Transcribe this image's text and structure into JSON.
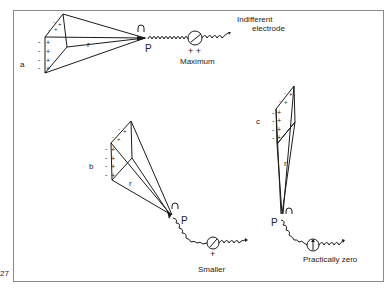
{
  "figure": {
    "page_number": "27",
    "frame_color": "#8a8a8a",
    "ink_color": "#1a1a1a"
  },
  "indifferent_electrode": {
    "line1": "Indifferent",
    "line2": "electrode"
  },
  "panels": [
    {
      "id": "a",
      "label": "a",
      "radius_label": "r",
      "point_label": "P",
      "meter_sign": "+ +",
      "reading": "Maximum"
    },
    {
      "id": "b",
      "label": "b",
      "radius_label": "r",
      "point_label": "P",
      "meter_sign": "+",
      "reading": "Smaller"
    },
    {
      "id": "c",
      "label": "c",
      "radius_label": "r",
      "point_label": "P",
      "meter_sign": "",
      "reading": "Practically zero"
    }
  ],
  "charges": {
    "positive": "+",
    "negative": "-"
  }
}
